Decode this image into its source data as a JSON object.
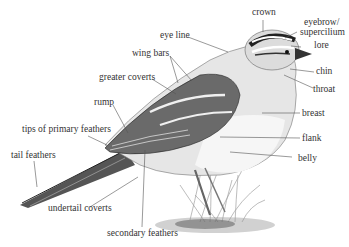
{
  "diagram": {
    "labels": {
      "crown": "crown",
      "eyebrow": "eyebrow/",
      "supercilium": "supercilium",
      "eye_line": "eye line",
      "lore": "lore",
      "wing_bars": "wing bars",
      "chin": "chin",
      "greater_coverts": "greater coverts",
      "throat": "throat",
      "rump": "rump",
      "breast": "breast",
      "tips_primary": "tips of primary feathers",
      "flank": "flank",
      "tail_feathers": "tail feathers",
      "belly": "belly",
      "undertail_coverts": "undertail coverts",
      "secondary_feathers": "secondary feathers"
    },
    "colors": {
      "label_text": "#333333",
      "leader_line": "#555555",
      "ink_dark": "#222222",
      "ink_mid": "#777777",
      "background": "#ffffff"
    }
  }
}
